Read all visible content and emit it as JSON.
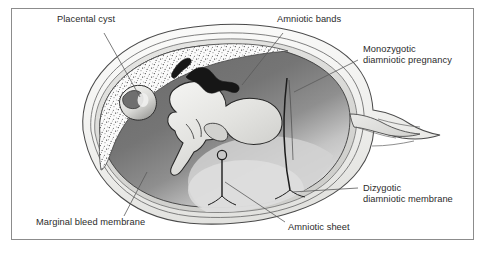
{
  "figure": {
    "frame_color": "#8c8c8c",
    "background_color": "#ffffff",
    "text_color": "#2b2b2b"
  },
  "palette": {
    "outer_wall": "#f2f2f0",
    "wall_stroke": "#555555",
    "chorion_band": "#dcdcda",
    "cavity_dark": "#6f6f6f",
    "cavity_mid": "#868686",
    "cavity_light": "#d9d9d9",
    "placenta_stipple_bg": "#fbfbfb",
    "fetus_fill": "#e4e4e2",
    "cyst_fill": "#ededeb",
    "band_stroke": "#1a1a1a"
  },
  "labels": [
    {
      "id": "placental-cyst",
      "text": "Placental cyst",
      "x": 57,
      "y": 18,
      "leader": {
        "x1": 104,
        "y1": 33,
        "x2": 140,
        "y2": 97
      }
    },
    {
      "id": "amniotic-bands",
      "text": "Amniotic bands",
      "x": 277,
      "y": 18,
      "leader": {
        "x1": 283,
        "y1": 33,
        "x2": 242,
        "y2": 85
      }
    },
    {
      "id": "monozygotic-diamniotic-pregnancy",
      "line1": "Monozygotic",
      "line2": "diamniotic pregnancy",
      "text": "Monozygotic\ndiamniotic pregnancy",
      "x": 363,
      "y": 48,
      "leader": {
        "x1": 358,
        "y1": 60,
        "x2": 294,
        "y2": 92
      }
    },
    {
      "id": "dizygotic-diamniotic-membrane",
      "line1": "Dizygotic",
      "line2": "diamniotic membrane",
      "text": "Dizygotic\ndiamniotic membrane",
      "x": 363,
      "y": 180,
      "leader": {
        "x1": 358,
        "y1": 188,
        "x2": 292,
        "y2": 192
      }
    },
    {
      "id": "amniotic-sheet",
      "text": "Amniotic sheet",
      "x": 288,
      "y": 225,
      "leader": {
        "x1": 285,
        "y1": 224,
        "x2": 225,
        "y2": 182
      }
    },
    {
      "id": "marginal-bleed-membrane",
      "text": "Marginal bleed membrane",
      "x": 36,
      "y": 221,
      "leader": {
        "x1": 124,
        "y1": 219,
        "x2": 147,
        "y2": 175
      }
    }
  ],
  "structures": [
    {
      "id": "uterine-wall",
      "name": "uterine wall outline"
    },
    {
      "id": "chorionic-layer",
      "name": "chorionic membrane layer"
    },
    {
      "id": "placenta",
      "name": "stippled placenta"
    },
    {
      "id": "placental-cyst-shape",
      "name": "placental cyst"
    },
    {
      "id": "amniotic-cavity",
      "name": "amniotic cavity"
    },
    {
      "id": "fetus",
      "name": "fetus"
    },
    {
      "id": "amniotic-band-1",
      "name": "amniotic band upper"
    },
    {
      "id": "amniotic-band-2",
      "name": "amniotic band right"
    },
    {
      "id": "amniotic-sheet-shape",
      "name": "amniotic sheet with free edge"
    },
    {
      "id": "dizygotic-membrane-shape",
      "name": "dizygotic diamniotic membrane"
    },
    {
      "id": "cervical-canal",
      "name": "cervical canal / outlet"
    }
  ]
}
